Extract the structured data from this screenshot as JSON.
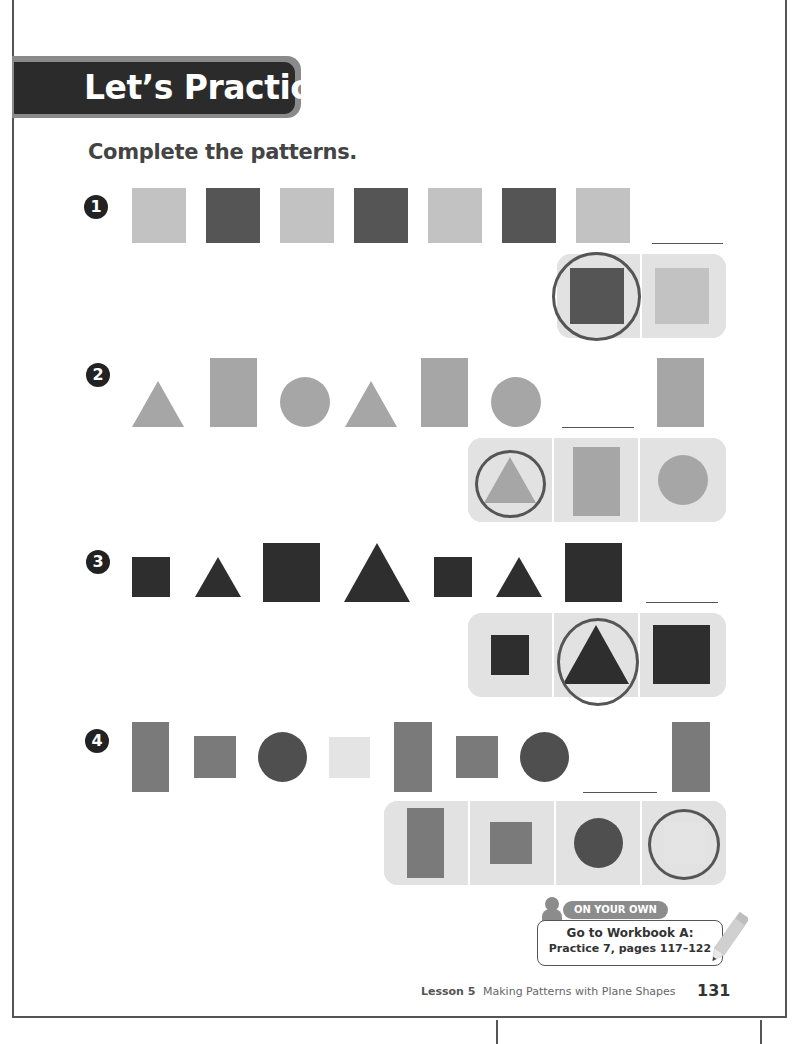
{
  "header": {
    "title": "Let’s Practice"
  },
  "instruction": "Complete the patterns.",
  "colors": {
    "light_gray": "#c2c2c2",
    "dark_gray": "#555555",
    "mid_gray": "#a6a6a6",
    "near_black": "#2e2e2e",
    "medium": "#7a7a7a",
    "pale": "#e4e4e4",
    "panel_bg": "#e2e2e2",
    "banner_dark": "#2b2b2b"
  },
  "problems": [
    {
      "number": "1",
      "sequence": [
        "light square",
        "dark square",
        "light square",
        "dark square",
        "light square",
        "dark square",
        "light square",
        "blank"
      ],
      "options": [
        "dark square",
        "light square"
      ],
      "selected_option": 0
    },
    {
      "number": "2",
      "sequence": [
        "triangle",
        "rectangle",
        "circle",
        "triangle",
        "rectangle",
        "circle",
        "blank",
        "rectangle"
      ],
      "options": [
        "triangle",
        "rectangle",
        "circle"
      ],
      "selected_option": 0
    },
    {
      "number": "3",
      "sequence": [
        "small square",
        "small triangle",
        "big square",
        "big triangle",
        "small square",
        "small triangle",
        "big square",
        "blank"
      ],
      "options": [
        "small square",
        "big triangle",
        "big square"
      ],
      "selected_option": 1
    },
    {
      "number": "4",
      "sequence": [
        "tall rectangle",
        "square",
        "dark circle",
        "light square",
        "tall rectangle",
        "square",
        "dark circle",
        "blank",
        "tall rectangle"
      ],
      "options": [
        "tall rectangle",
        "square",
        "dark circle",
        "light square"
      ],
      "selected_option": 3
    }
  ],
  "on_your_own": {
    "label": "ON YOUR OWN",
    "line1": "Go to Workbook A:",
    "line2": "Practice 7, pages 117–122"
  },
  "footer": {
    "lesson": "Lesson 5",
    "title": "Making Patterns with Plane Shapes",
    "page_number": "131"
  }
}
